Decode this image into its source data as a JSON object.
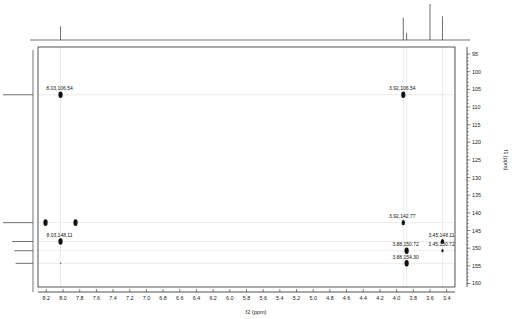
{
  "figure": {
    "type": "2d-nmr-spectrum",
    "experiment": "HMBC",
    "background_color": "#ffffff",
    "peak_color": "#111111",
    "grid_color": "#d8d8d8",
    "frame_color": "#2a2a2a"
  },
  "axes": {
    "x": {
      "label": "f2 (ppm)",
      "min": 3.3,
      "max": 8.3,
      "direction": "reversed",
      "ticks": [
        8.2,
        8.0,
        7.8,
        7.6,
        7.4,
        7.2,
        7.0,
        6.8,
        6.6,
        6.4,
        6.2,
        6.0,
        5.8,
        5.6,
        5.4,
        5.2,
        5.0,
        4.8,
        4.6,
        4.4,
        4.2,
        4.0,
        3.8,
        3.6,
        3.4
      ],
      "tick_labels": [
        "8.2",
        "8.0",
        "7.8",
        "7.6",
        "7.4",
        "7.2",
        "7.0",
        "6.8",
        "6.6",
        "6.4",
        "6.2",
        "6.0",
        "5.8",
        "5.6",
        "5.4",
        "5.2",
        "5.0",
        "4.8",
        "4.6",
        "4.4",
        "4.2",
        "4.0",
        "3.8",
        "3.6",
        "3.4"
      ]
    },
    "y": {
      "label": "f1 (ppm)",
      "min": 93,
      "max": 161,
      "direction": "reversed",
      "ticks": [
        95,
        100,
        105,
        110,
        115,
        120,
        125,
        130,
        135,
        140,
        145,
        150,
        155,
        160
      ],
      "tick_labels": [
        "95",
        "100",
        "105",
        "110",
        "115",
        "120",
        "125",
        "130",
        "135",
        "140",
        "145",
        "150",
        "155",
        "160"
      ]
    }
  },
  "chart_data": {
    "type": "scatter",
    "title": "",
    "subtitle": "",
    "xlabel": "f2 (ppm)",
    "ylabel": "f1 (ppm)",
    "xlim": [
      8.3,
      3.3
    ],
    "ylim": [
      161,
      93
    ],
    "grid": true,
    "legend": "none",
    "cross_peaks": [
      {
        "id": "cp1",
        "x": 8.03,
        "y": 106.54,
        "label": "8.03,106.54",
        "label_side": "left",
        "intensity": "strong"
      },
      {
        "id": "cp2",
        "x": 3.92,
        "y": 106.54,
        "label": "3.92,106.54",
        "label_side": "left",
        "intensity": "strong"
      },
      {
        "id": "cp3",
        "x": 8.21,
        "y": 142.77,
        "label": "",
        "label_side": "none",
        "intensity": "strong"
      },
      {
        "id": "cp4",
        "x": 7.85,
        "y": 142.77,
        "label": "",
        "label_side": "none",
        "intensity": "strong"
      },
      {
        "id": "cp5",
        "x": 3.92,
        "y": 142.77,
        "label": "3.92,142.77",
        "label_side": "left",
        "intensity": "medium"
      },
      {
        "id": "cp6",
        "x": 8.03,
        "y": 148.11,
        "label": "8.03,148.11",
        "label_side": "left",
        "intensity": "strong"
      },
      {
        "id": "cp7",
        "x": 3.45,
        "y": 148.11,
        "label": "3.45,148.11",
        "label_side": "left",
        "intensity": "medium"
      },
      {
        "id": "cp8",
        "x": 3.88,
        "y": 150.72,
        "label": "3.88,150.72",
        "label_side": "left",
        "intensity": "strong"
      },
      {
        "id": "cp9",
        "x": 3.45,
        "y": 150.72,
        "label": "3.45,150.72",
        "label_side": "left",
        "intensity": "weak"
      },
      {
        "id": "cp10",
        "x": 3.88,
        "y": 154.3,
        "label": "3.88,154.30",
        "label_side": "left",
        "intensity": "strong"
      },
      {
        "id": "cp11",
        "x": 8.03,
        "y": 154.3,
        "label": "",
        "label_side": "none",
        "intensity": "trace"
      }
    ],
    "top_projection": {
      "name": "proton-1d-projection",
      "nucleus": "1H",
      "peaks": [
        {
          "shift": 8.03,
          "height": 0.38
        },
        {
          "shift": 3.92,
          "height": 0.62
        },
        {
          "shift": 3.88,
          "height": 0.2
        },
        {
          "shift": 3.6,
          "height": 1.0
        },
        {
          "shift": 3.45,
          "height": 0.66
        }
      ]
    },
    "left_projection": {
      "name": "carbon-1d-projection",
      "nucleus": "13C",
      "peaks": [
        {
          "shift": 106.54,
          "height": 1.0
        },
        {
          "shift": 142.77,
          "height": 1.0
        },
        {
          "shift": 148.11,
          "height": 0.7
        },
        {
          "shift": 150.72,
          "height": 0.62
        },
        {
          "shift": 154.3,
          "height": 0.58
        }
      ]
    },
    "correlation_guides": {
      "vertical_at_x": [
        8.03,
        3.92,
        3.88,
        3.45
      ],
      "horizontal_at_y": [
        106.54,
        142.77,
        148.11,
        150.72,
        154.3
      ]
    }
  }
}
